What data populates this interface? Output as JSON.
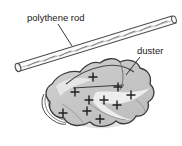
{
  "figure": {
    "background_color": "#ffffff",
    "labels": [
      {
        "id": "polythene-rod",
        "text": "polythene rod",
        "x": 27,
        "y": 21,
        "leader_from": [
          58,
          24
        ],
        "leader_to": [
          72,
          46
        ]
      },
      {
        "id": "duster",
        "text": "duster",
        "x": 137,
        "y": 54,
        "leader_from": [
          140,
          57
        ],
        "leader_to": [
          126,
          75
        ]
      }
    ]
  },
  "rod": {
    "name": "polythene rod",
    "fill_color": "#fdfdfd",
    "stroke_color": "#4a4a4a",
    "hatch_marks": 9,
    "angle_description": "diagonal from lower-left to upper-right",
    "end_cap": "ellipse at lower-left end"
  },
  "duster": {
    "name": "duster cloth",
    "fill_color": "#c9c9c9",
    "highlight_color": "#efefef",
    "stroke_color": "#3a3a3a",
    "shadow_color": "#d8d8d8",
    "description": "crumpled star-shaped cloth with folded layers at the left edge",
    "charge_symbol": "+",
    "charge_sign": "positive",
    "charge_count": 10,
    "charges": [
      {
        "x": 93,
        "y": 77
      },
      {
        "x": 75,
        "y": 92
      },
      {
        "x": 118,
        "y": 87
      },
      {
        "x": 131,
        "y": 95
      },
      {
        "x": 89,
        "y": 100
      },
      {
        "x": 104,
        "y": 100
      },
      {
        "x": 117,
        "y": 105
      },
      {
        "x": 87,
        "y": 111
      },
      {
        "x": 63,
        "y": 113
      },
      {
        "x": 100,
        "y": 119
      }
    ]
  }
}
